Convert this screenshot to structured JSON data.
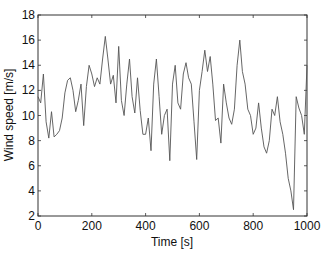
{
  "chart_data": {
    "type": "line",
    "title": "",
    "xlabel": "Time [s]",
    "ylabel": "Wind speed [m/s]",
    "xlim": [
      0,
      1000
    ],
    "ylim": [
      2,
      18
    ],
    "xticks": [
      0,
      200,
      400,
      600,
      800,
      1000
    ],
    "yticks": [
      2,
      4,
      6,
      8,
      10,
      12,
      14,
      16,
      18
    ],
    "grid": false,
    "legend": null,
    "series": [
      {
        "name": "Wind speed",
        "color": "#555555",
        "x": [
          0,
          10,
          20,
          30,
          40,
          50,
          60,
          70,
          80,
          90,
          100,
          110,
          120,
          130,
          140,
          150,
          160,
          170,
          180,
          190,
          200,
          210,
          220,
          230,
          240,
          250,
          260,
          270,
          280,
          290,
          300,
          310,
          320,
          330,
          340,
          350,
          360,
          370,
          380,
          390,
          400,
          410,
          420,
          430,
          440,
          450,
          460,
          470,
          480,
          490,
          500,
          510,
          520,
          530,
          540,
          550,
          560,
          570,
          580,
          590,
          600,
          610,
          620,
          630,
          640,
          650,
          660,
          670,
          680,
          690,
          700,
          710,
          720,
          730,
          740,
          750,
          760,
          770,
          780,
          790,
          800,
          810,
          820,
          830,
          840,
          850,
          860,
          870,
          880,
          890,
          900,
          910,
          920,
          930,
          940,
          950,
          960,
          970,
          980,
          990,
          1000
        ],
        "y": [
          11.5,
          11.0,
          13.3,
          9.5,
          8.2,
          10.3,
          8.3,
          8.5,
          8.8,
          9.8,
          11.8,
          12.8,
          13.0,
          12.0,
          10.3,
          11.2,
          12.5,
          9.2,
          12.3,
          14.0,
          13.3,
          12.3,
          13.0,
          12.5,
          14.5,
          16.3,
          14.5,
          12.5,
          13.2,
          11.0,
          15.5,
          11.2,
          10.0,
          12.5,
          14.5,
          11.5,
          10.2,
          13.0,
          10.4,
          8.5,
          8.5,
          9.8,
          7.2,
          12.5,
          14.5,
          11.5,
          8.5,
          10.0,
          10.5,
          6.4,
          12.5,
          14.0,
          11.0,
          10.5,
          13.3,
          14.2,
          13.0,
          12.5,
          9.5,
          6.5,
          12.0,
          13.5,
          15.2,
          13.5,
          14.7,
          12.5,
          9.6,
          9.8,
          7.8,
          12.5,
          11.0,
          9.8,
          9.3,
          10.5,
          14.0,
          16.0,
          13.5,
          12.5,
          10.5,
          10.0,
          8.5,
          9.0,
          11.0,
          9.0,
          7.5,
          7.0,
          8.0,
          10.5,
          10.0,
          11.5,
          9.5,
          8.5,
          7.0,
          5.0,
          4.0,
          2.5,
          11.5,
          10.6,
          10.0,
          8.5,
          14.0
        ]
      }
    ]
  }
}
